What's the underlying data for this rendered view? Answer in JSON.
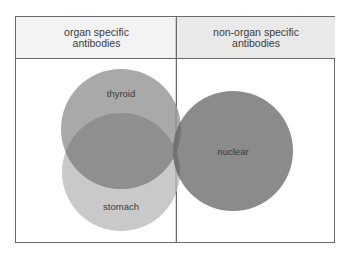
{
  "headers": {
    "left": "organ specific antibodies",
    "right": "non-organ specific antibodies"
  },
  "circles": {
    "thyroid": {
      "label": "thyroid",
      "cx": 121,
      "cy": 129,
      "r": 60,
      "color": "#a9a9a9"
    },
    "stomach": {
      "label": "stomach",
      "cx": 121,
      "cy": 172,
      "r": 59,
      "color": "#c9c9c9"
    },
    "nuclear": {
      "label": "nuclear",
      "cx": 233,
      "cy": 151,
      "r": 60,
      "color": "#8b8b8b"
    }
  },
  "colors": {
    "border": "#6a6a6a",
    "header_left_bg": "#f3f3f3",
    "header_right_bg": "#e9e9e9",
    "overlap_thyroid_stomach": "#8f8f8f",
    "overlap_with_nuclear": "#6f6f6f"
  }
}
